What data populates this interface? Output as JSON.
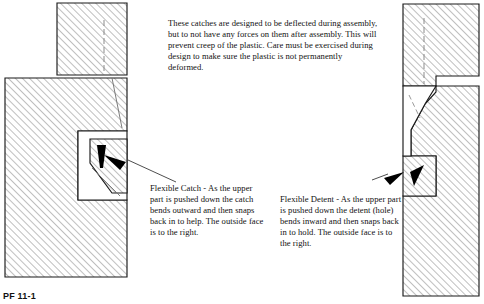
{
  "figure": {
    "label": "PF 11-1",
    "note": "These catches are designed to be deflected during assembly, but to not have any forces on them after assembly. This will prevent creep of the plastic. Care must be exercised during design to make sure the plastic is not permanently deformed.",
    "captions": {
      "left": "Flexible Catch - As the upper part is pushed down the catch bends outward and then snaps back in to help. The outside face is to the right.",
      "right": "Flexible Detent - As the upper part is pushed down the detent (hole) bends inward and then snaps back in to hold. The outside face is to the right."
    }
  },
  "colors": {
    "outline": "#1a1a1a",
    "hatch": "#8a8a8a",
    "hidden_line": "#8a8a8a",
    "arrow_fill": "#000000",
    "background": "#ffffff"
  },
  "views": [
    {
      "name": "flexible-catch-section",
      "title": "Flexible Catch",
      "parts": [
        {
          "name": "upper-part",
          "description": "hatched block, top left, sectioned"
        },
        {
          "name": "lower-part",
          "description": "large hatched block below and left"
        },
        {
          "name": "catch-tongue",
          "description": "angled flexible catch inside white pocket"
        },
        {
          "name": "pocket",
          "description": "white clearance pocket around catch"
        }
      ],
      "annotations": [
        {
          "name": "deflection-arrow",
          "direction": "down"
        },
        {
          "name": "leader-arrow",
          "direction": "up-left",
          "points_to": "catch-tongue"
        }
      ]
    },
    {
      "name": "flexible-detent-section",
      "title": "Flexible Detent",
      "parts": [
        {
          "name": "upper-part",
          "description": "hatched block at top right, sectioned"
        },
        {
          "name": "lower-part",
          "description": "large hatched block below"
        },
        {
          "name": "detent-hole",
          "description": "hole feature that bends inward"
        },
        {
          "name": "ramp",
          "description": "angled lead-in ramp surface"
        }
      ],
      "annotations": [
        {
          "name": "deflection-arrow",
          "direction": "down-left"
        },
        {
          "name": "leader-arrow",
          "direction": "right",
          "points_to": "detent-hole"
        }
      ]
    }
  ]
}
